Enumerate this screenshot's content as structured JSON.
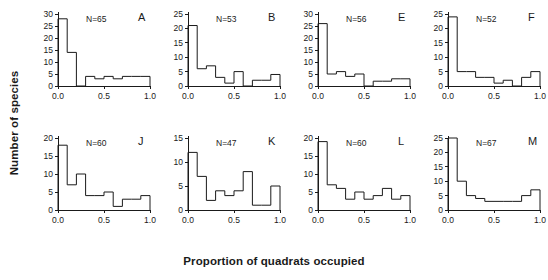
{
  "figure": {
    "ylabel": "Number of species",
    "xlabel": "Proportion of quadrats occupied"
  },
  "chart_data": {
    "type": "bar",
    "title": "",
    "xlabel": "Proportion of quadrats occupied",
    "ylabel": "Number of species",
    "grid": false,
    "legend": "none",
    "bin_edges": [
      0.0,
      0.1,
      0.2,
      0.3,
      0.4,
      0.5,
      0.6,
      0.7,
      0.8,
      0.9,
      1.0
    ],
    "xlim": [
      0.0,
      1.0
    ],
    "xticks": [
      0.0,
      0.5,
      1.0
    ],
    "xticklabels": [
      "0.0",
      "0.5",
      "1.0"
    ],
    "panels": [
      {
        "letter": "A",
        "n_label": "N=65",
        "n": 65,
        "ylim": [
          0,
          30
        ],
        "yticks": [
          0,
          5,
          10,
          15,
          20,
          25,
          30
        ],
        "yticklabels": [
          "0",
          "5",
          "10",
          "15",
          "20",
          "25",
          "30"
        ],
        "values": [
          28,
          14,
          0,
          4,
          3,
          4,
          3,
          4,
          4,
          4
        ]
      },
      {
        "letter": "B",
        "n_label": "N=53",
        "n": 53,
        "ylim": [
          0,
          25
        ],
        "yticks": [
          0,
          5,
          10,
          15,
          20,
          25
        ],
        "yticklabels": [
          "0",
          "5",
          "10",
          "15",
          "20",
          "25"
        ],
        "values": [
          21,
          6,
          7,
          3,
          1,
          5,
          0,
          2,
          2,
          4
        ]
      },
      {
        "letter": "E",
        "n_label": "N=56",
        "n": 56,
        "ylim": [
          0,
          30
        ],
        "yticks": [
          0,
          5,
          10,
          15,
          20,
          25,
          30
        ],
        "yticklabels": [
          "0",
          "5",
          "10",
          "15",
          "20",
          "25",
          "30"
        ],
        "values": [
          26,
          5,
          6,
          4,
          5,
          0,
          2,
          2,
          3,
          3
        ]
      },
      {
        "letter": "F",
        "n_label": "N=52",
        "n": 52,
        "ylim": [
          0,
          25
        ],
        "yticks": [
          0,
          5,
          10,
          15,
          20,
          25
        ],
        "yticklabels": [
          "0",
          "5",
          "10",
          "15",
          "20",
          "25"
        ],
        "values": [
          24,
          5,
          5,
          3,
          3,
          1,
          2,
          0,
          3,
          5
        ]
      },
      {
        "letter": "J",
        "n_label": "N=60",
        "n": 60,
        "ylim": [
          0,
          20
        ],
        "yticks": [
          0,
          5,
          10,
          15,
          20
        ],
        "yticklabels": [
          "0",
          "5",
          "10",
          "15",
          "20"
        ],
        "values": [
          18,
          7,
          10,
          4,
          4,
          5,
          1,
          3,
          3,
          4
        ]
      },
      {
        "letter": "K",
        "n_label": "N=47",
        "n": 47,
        "ylim": [
          0,
          15
        ],
        "yticks": [
          0,
          5,
          10,
          15
        ],
        "yticklabels": [
          "0",
          "5",
          "10",
          "15"
        ],
        "values": [
          12,
          7,
          2,
          4,
          3,
          4,
          8,
          1,
          1,
          5
        ]
      },
      {
        "letter": "L",
        "n_label": "N=60",
        "n": 60,
        "ylim": [
          0,
          20
        ],
        "yticks": [
          0,
          5,
          10,
          15,
          20
        ],
        "yticklabels": [
          "0",
          "5",
          "10",
          "15",
          "20"
        ],
        "values": [
          19,
          7,
          6,
          3,
          5,
          3,
          4,
          6,
          3,
          4
        ]
      },
      {
        "letter": "M",
        "n_label": "N=67",
        "n": 67,
        "ylim": [
          0,
          25
        ],
        "yticks": [
          0,
          5,
          10,
          15,
          20,
          25
        ],
        "yticklabels": [
          "0",
          "5",
          "10",
          "15",
          "20",
          "25"
        ],
        "values": [
          25,
          10,
          5,
          4,
          3,
          3,
          3,
          3,
          5,
          7
        ]
      }
    ]
  }
}
